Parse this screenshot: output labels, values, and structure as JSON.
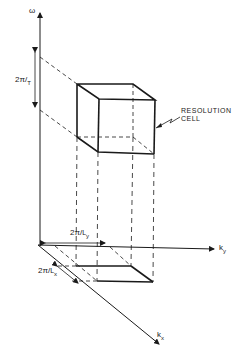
{
  "figure": {
    "type": "3D resolution cell diagram",
    "axes": {
      "omega": "ω",
      "ky": "k",
      "ky_sub": "y",
      "kx": "k",
      "kx_sub": "x"
    },
    "labels": {
      "time_res_num": "2π",
      "time_res_den": "T",
      "ly_res_num": "2π",
      "ly_res_den": "L",
      "ly_res_sub": "y",
      "lx_res_num": "2π",
      "lx_res_den": "L",
      "lx_res_sub": "x",
      "cell_line1": "RESOLUTION",
      "cell_line2": "CELL"
    },
    "colors": {
      "ink": "#1a1a1a",
      "background": "#ffffff"
    }
  }
}
